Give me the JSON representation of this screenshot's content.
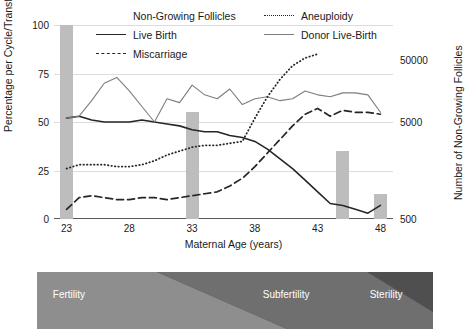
{
  "legend": {
    "items": [
      {
        "label": "Non-Growing Follicles",
        "key": "bar-swatch-icon"
      },
      {
        "label": "Aneuploidy",
        "key": "dotted-line-icon"
      },
      {
        "label": "Live Birth",
        "key": "solid-line-icon"
      },
      {
        "label": "Donor Live-Birth",
        "key": "thin-line-icon"
      },
      {
        "label": "Miscarriage",
        "key": "dashed-line-icon"
      }
    ]
  },
  "axes": {
    "left_label": "Percentage per Cycle/Transfer",
    "right_label": "Number of Non-Growing Follicles",
    "x_label": "Maternal Age (years)",
    "left_ticks": [
      "0",
      "25",
      "50",
      "75",
      "100"
    ],
    "right_ticks": [
      "500",
      "5000",
      "50000"
    ],
    "x_ticks": [
      "23",
      "28",
      "33",
      "38",
      "43",
      "48"
    ]
  },
  "strip": {
    "labels": [
      {
        "text": "Fertility",
        "left_pct": 4
      },
      {
        "text": "Subfertility",
        "left_pct": 57
      },
      {
        "text": "Sterility",
        "left_pct": 84
      }
    ],
    "colors": {
      "light": "#8e8e8e",
      "mid": "#6f6f6f",
      "dark": "#4f4f4f"
    }
  },
  "colors": {
    "bar": "#bdbdbd",
    "live_birth": "#262626",
    "miscarriage": "#262626",
    "aneuploidy": "#262626",
    "donor": "#7d7d7d",
    "grid": "#dcdcdc",
    "axis": "#5a5a5a"
  },
  "chart_data": {
    "type": "line",
    "title": "",
    "xlabel": "Maternal Age (years)",
    "ylabel": "Percentage per Cycle/Transfer",
    "y2label": "Number of Non-Growing Follicles",
    "xlim": [
      22,
      49
    ],
    "ylim": [
      0,
      100
    ],
    "y2lim_log": [
      500,
      50000
    ],
    "y2_scale": "log",
    "grid": true,
    "legend_position": "top",
    "bars": {
      "name": "Non-Growing Follicles",
      "unit": "count (right log axis)",
      "x": [
        23,
        33,
        45,
        48
      ],
      "percent_height": [
        100,
        55,
        35,
        13
      ],
      "approx_count": [
        50000,
        5000,
        1500,
        700
      ]
    },
    "series": [
      {
        "name": "Live Birth",
        "style": "solid",
        "x": [
          23,
          24,
          25,
          26,
          27,
          28,
          29,
          30,
          31,
          32,
          33,
          34,
          35,
          36,
          37,
          38,
          39,
          40,
          41,
          42,
          43,
          44,
          45,
          46,
          47,
          48
        ],
        "values": [
          52,
          53,
          51,
          50,
          50,
          50,
          51,
          50,
          49,
          48,
          46,
          45,
          45,
          43,
          42,
          40,
          36,
          31,
          26,
          20,
          14,
          8,
          7,
          5,
          3,
          7
        ]
      },
      {
        "name": "Donor Live-Birth",
        "style": "solid-thin",
        "x": [
          23,
          24,
          25,
          26,
          27,
          28,
          29,
          30,
          31,
          32,
          33,
          34,
          35,
          36,
          37,
          38,
          39,
          40,
          41,
          42,
          43,
          44,
          45,
          46,
          47,
          48
        ],
        "values": [
          52,
          53,
          61,
          70,
          73,
          66,
          58,
          50,
          62,
          60,
          69,
          64,
          62,
          67,
          59,
          62,
          63,
          61,
          62,
          66,
          64,
          63,
          65,
          65,
          64,
          55
        ]
      },
      {
        "name": "Aneuploidy",
        "style": "dotted",
        "x": [
          23,
          24,
          25,
          26,
          27,
          28,
          29,
          30,
          31,
          32,
          33,
          34,
          35,
          36,
          37,
          38,
          39,
          40,
          41,
          42,
          43
        ],
        "values": [
          26,
          28,
          28,
          28,
          27,
          27,
          28,
          30,
          33,
          35,
          37,
          38,
          38,
          39,
          40,
          52,
          63,
          72,
          79,
          83,
          85
        ]
      },
      {
        "name": "Miscarriage",
        "style": "dashed",
        "x": [
          23,
          24,
          25,
          26,
          27,
          28,
          29,
          30,
          31,
          32,
          33,
          34,
          35,
          36,
          37,
          38,
          39,
          40,
          41,
          42,
          43,
          44,
          45,
          46,
          47,
          48
        ],
        "values": [
          5,
          11,
          12,
          11,
          10,
          10,
          11,
          11,
          10,
          11,
          12,
          13,
          14,
          17,
          21,
          27,
          34,
          41,
          48,
          54,
          57,
          53,
          56,
          55,
          55,
          54
        ]
      }
    ]
  }
}
